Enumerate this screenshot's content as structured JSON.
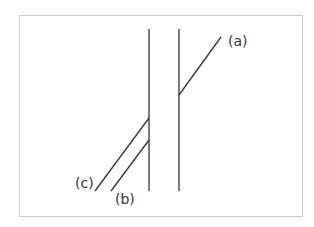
{
  "diagram": {
    "line_color": "#333333",
    "frame_color": "#cfcfcf",
    "labels": {
      "a": "(a)",
      "b": "(b)",
      "c": "(c)"
    },
    "vertical_bars": [
      {
        "x": 149,
        "y1": 29,
        "y2": 191
      },
      {
        "x": 179,
        "y1": 29,
        "y2": 191
      }
    ],
    "segments": {
      "a": {
        "x1": 179,
        "y1": 95,
        "x2": 221,
        "y2": 37
      },
      "b": {
        "x1": 149,
        "y1": 140,
        "x2": 111,
        "y2": 191
      },
      "c": {
        "x1": 149,
        "y1": 118,
        "x2": 95,
        "y2": 191
      }
    }
  }
}
